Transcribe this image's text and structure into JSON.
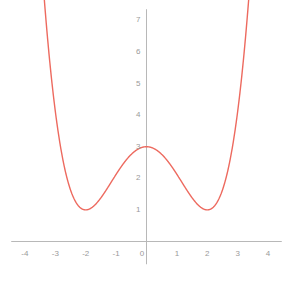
{
  "chart_data": {
    "type": "line",
    "title": "",
    "subtitle": "",
    "xlabel": "",
    "ylabel": "",
    "xlim": [
      -4.45,
      4.45
    ],
    "ylim": [
      -0.72,
      7.35
    ],
    "grid": false,
    "legend": null,
    "axis_style": "centered-cross",
    "curve_color": "#ed6a5f",
    "axis_color": "#b8b8b8",
    "tick_label_color": "#9a9a9a",
    "background_color": "#ffffff",
    "x_ticks": [
      {
        "value": -4,
        "label": "-4"
      },
      {
        "value": -3,
        "label": "-3"
      },
      {
        "value": -2,
        "label": "-2"
      },
      {
        "value": -1,
        "label": "-1"
      },
      {
        "value": 0,
        "label": "0"
      },
      {
        "value": 1,
        "label": "1"
      },
      {
        "value": 2,
        "label": "2"
      },
      {
        "value": 3,
        "label": "3"
      },
      {
        "value": 4,
        "label": "4"
      }
    ],
    "y_ticks": [
      {
        "value": 1,
        "label": "1"
      },
      {
        "value": 2,
        "label": "2"
      },
      {
        "value": 3,
        "label": "3"
      },
      {
        "value": 4,
        "label": "4"
      },
      {
        "value": 5,
        "label": "5"
      },
      {
        "value": 6,
        "label": "6"
      },
      {
        "value": 7,
        "label": "7"
      }
    ],
    "series": [
      {
        "name": "f(x) = x^4/8 - x^2 + 3",
        "expression": "0.125*x^4 - x^2 + 3",
        "color": "#ed6a5f",
        "line_width": 1.4,
        "x_domain": [
          -3.42,
          3.42
        ],
        "key_points": [
          {
            "x": -2,
            "y": 1,
            "kind": "local-minimum"
          },
          {
            "x": 0,
            "y": 3,
            "kind": "local-maximum"
          },
          {
            "x": 2,
            "y": 1,
            "kind": "local-minimum"
          }
        ],
        "x": [
          -3.42,
          -3.3,
          -3.2,
          -3.1,
          -3.0,
          -2.9,
          -2.8,
          -2.7,
          -2.6,
          -2.5,
          -2.4,
          -2.3,
          -2.2,
          -2.1,
          -2.0,
          -1.9,
          -1.8,
          -1.7,
          -1.6,
          -1.5,
          -1.4,
          -1.3,
          -1.2,
          -1.1,
          -1.0,
          -0.9,
          -0.8,
          -0.7,
          -0.6,
          -0.5,
          -0.4,
          -0.3,
          -0.2,
          -0.1,
          0.0,
          0.1,
          0.2,
          0.3,
          0.4,
          0.5,
          0.6,
          0.7,
          0.8,
          0.9,
          1.0,
          1.1,
          1.2,
          1.3,
          1.4,
          1.5,
          1.6,
          1.7,
          1.8,
          1.9,
          2.0,
          2.1,
          2.2,
          2.3,
          2.4,
          2.5,
          2.6,
          2.7,
          2.8,
          2.9,
          3.0,
          3.1,
          3.2,
          3.3,
          3.42
        ],
        "y": [
          8.41,
          6.74,
          5.96,
          5.31,
          4.81,
          4.45,
          4.22,
          4.12,
          4.14,
          4.27,
          4.5,
          4.81,
          5.18,
          5.61,
          1.0,
          1.09,
          1.05,
          1.01,
          1.02,
          1.08,
          1.19,
          1.36,
          1.58,
          1.85,
          2.13,
          2.47,
          2.81,
          3.22,
          3.68,
          4.18,
          4.73,
          5.3,
          5.91,
          6.54,
          3.0,
          2.99,
          2.96,
          2.91,
          2.84,
          2.76,
          2.66,
          2.54,
          2.41,
          2.27,
          2.13,
          1.98,
          1.82,
          1.67,
          1.53,
          1.39,
          1.27,
          1.17,
          1.08,
          1.03,
          1.0,
          1.0,
          1.05,
          1.15,
          1.3,
          1.51,
          1.79,
          2.15,
          2.6,
          3.16,
          3.13,
          3.75,
          4.48,
          5.32,
          6.45
        ]
      }
    ],
    "formula_description": "Symmetric W-shaped quartic curve with local maximum at (0, 3) and two equal minima at (-2, 1) and (2, 1)."
  }
}
